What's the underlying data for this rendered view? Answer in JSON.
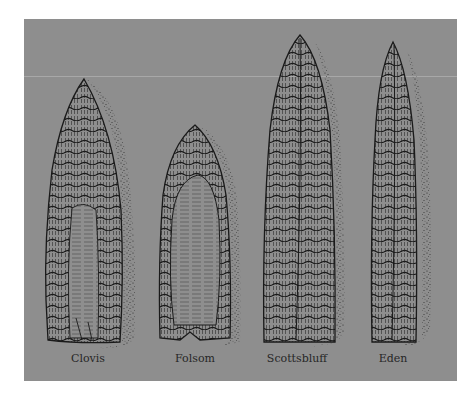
{
  "figure": {
    "background_color": "#8e8e8e",
    "ink_color": "#1e1e1e",
    "points": [
      {
        "id": "clovis",
        "label": "Clovis",
        "label_x": 88
      },
      {
        "id": "folsom",
        "label": "Folsom",
        "label_x": 195
      },
      {
        "id": "scottsbluff",
        "label": "Scottsbluff",
        "label_x": 297
      },
      {
        "id": "eden",
        "label": "Eden",
        "label_x": 393
      }
    ]
  }
}
